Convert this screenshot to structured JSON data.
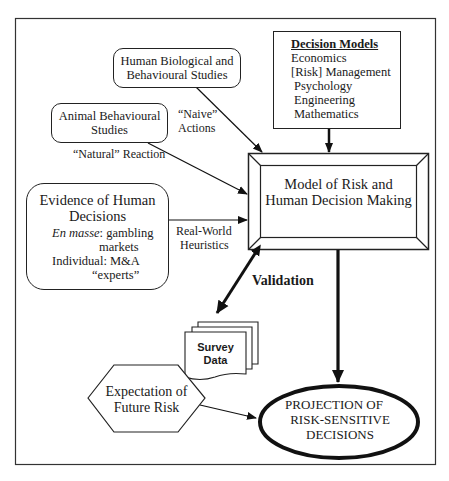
{
  "diagram": {
    "nodes": {
      "human_bio": {
        "lines": [
          "Human Biological and",
          "Behavioural Studies"
        ]
      },
      "decision_models": {
        "title": "Decision Models",
        "items": [
          "Economics",
          "[Risk] Management",
          "Psychology",
          "Engineering",
          "Mathematics"
        ]
      },
      "animal": {
        "lines": [
          "Animal Behavioural",
          "Studies"
        ]
      },
      "evidence": {
        "title_lines": [
          "Evidence of Human",
          "Decisions"
        ],
        "en_masse_label": "En masse",
        "en_masse_text": ": gambling",
        "en_masse_text2": "markets",
        "individual_text": "Individual: M&A",
        "individual_text2": "“experts”"
      },
      "model": {
        "lines": [
          "Model of Risk and",
          "Human Decision Making"
        ]
      },
      "survey": {
        "lines": [
          "Survey",
          "Data"
        ]
      },
      "expectation": {
        "lines": [
          "Expectation of",
          "Future Risk"
        ]
      },
      "projection": {
        "lines": [
          "PROJECTION OF",
          "RISK-SENSITIVE",
          "DECISIONS"
        ]
      }
    },
    "edge_labels": {
      "naive": [
        "“Naive”",
        "Actions"
      ],
      "natural": "“Natural” Reaction",
      "real_world": [
        "Real-World",
        "Heuristics"
      ],
      "validation": "Validation"
    },
    "colors": {
      "stroke": "#222222",
      "background": "#ffffff",
      "survey_highlight": "#e6e6e6"
    }
  }
}
